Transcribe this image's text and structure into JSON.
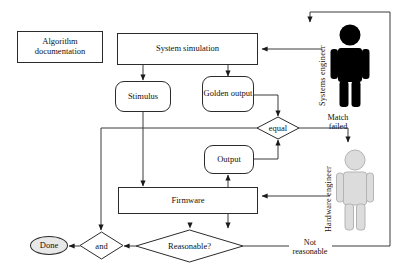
{
  "diagram": {
    "nodes": {
      "algorithm_doc": "Algorithm documentation",
      "system_simulation": "System simulation",
      "stimulus": "Stimulus",
      "golden_output": "Golden output",
      "output": "Output",
      "firmware": "Firmware",
      "done": "Done"
    },
    "decisions": {
      "equal": "equal",
      "and": "and",
      "reasonable": "Reasonable?"
    },
    "edge_labels": {
      "match_failed": "Match failed",
      "not_reasonable": "Not reasonable"
    },
    "actors": [
      {
        "name": "Systems engineer",
        "label": "Systems engineer",
        "color": "#000000"
      },
      {
        "name": "Hardware engineer",
        "label": "Hardware engineer",
        "color": "#d9d9d9"
      }
    ],
    "colors": {
      "stroke": "#2b2b2b",
      "node_fill": "#ffffff",
      "terminal_fill": "#e8e8e8",
      "systems_engineer": "#000000",
      "hardware_engineer": "#d9d9d9",
      "background": "#ffffff"
    }
  }
}
